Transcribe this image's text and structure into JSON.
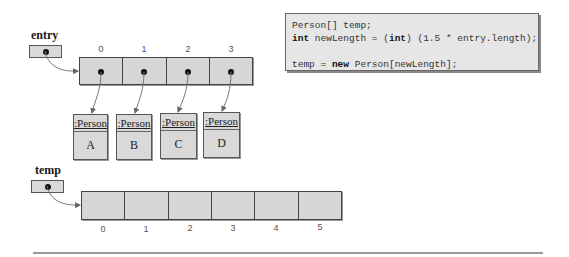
{
  "entry": {
    "label": "entry",
    "indices": [
      "0",
      "1",
      "2",
      "3"
    ]
  },
  "persons": [
    {
      "type": ":Person",
      "name": "A"
    },
    {
      "type": ":Person",
      "name": "B"
    },
    {
      "type": ":Person",
      "name": "C"
    },
    {
      "type": ":Person",
      "name": "D"
    }
  ],
  "temp": {
    "label": "temp",
    "indices": [
      "0",
      "1",
      "2",
      "3",
      "4",
      "5"
    ]
  },
  "code": {
    "line1": "Person[] temp;",
    "line2_kw1": "int",
    "line2_a": " newLength = (",
    "line2_kw2": "int",
    "line2_b": ") (1.5 * entry.length);",
    "line3_a": "temp = ",
    "line3_kw": "new",
    "line3_b": " Person[newLength];"
  },
  "colors": {
    "cell_fill": "#d6d6d6",
    "code_bg": "#e6e6e6",
    "border": "#444444"
  }
}
